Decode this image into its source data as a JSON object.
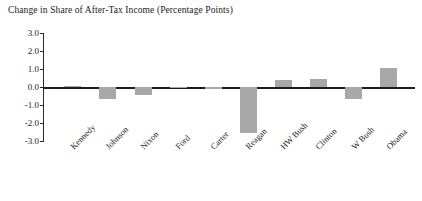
{
  "chart_data": {
    "type": "bar",
    "title": "Change in Share of After-Tax Income (Percentage Points)",
    "xlabel": "",
    "ylabel": "",
    "ylim": [
      -3.0,
      3.0
    ],
    "ytick_labels": [
      "3.0",
      "2.0",
      "1.0",
      "0.0",
      "-1.0",
      "-2.0",
      "-3.0"
    ],
    "ytick_values": [
      3.0,
      2.0,
      1.0,
      0.0,
      -1.0,
      -2.0,
      -3.0
    ],
    "grid": false,
    "legend": false,
    "bar_color": "#a8a8a8",
    "axis_color": "#2b2b2b",
    "categories": [
      "Kennedy",
      "Johnson",
      "Nixon",
      "Ford",
      "Carter",
      "Reagan",
      "HW Bush",
      "Clinton",
      "W Bush",
      "Obama"
    ],
    "values": [
      0.05,
      -0.65,
      -0.42,
      -0.02,
      -0.1,
      -2.55,
      0.4,
      0.42,
      -0.65,
      1.05
    ]
  }
}
